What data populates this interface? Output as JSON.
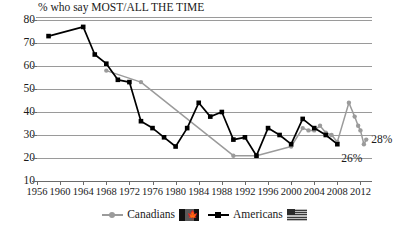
{
  "chart_data": {
    "type": "line",
    "title": "% who say MOST/ALL THE TIME",
    "xlabel": "",
    "ylabel": "",
    "ylim": [
      10,
      80
    ],
    "xlim": [
      1956,
      2014
    ],
    "yticks": [
      80,
      70,
      60,
      50,
      40,
      30,
      20,
      10
    ],
    "xticks": [
      1956,
      1960,
      1964,
      1968,
      1972,
      1976,
      1980,
      1984,
      1988,
      1992,
      1996,
      2000,
      2004,
      2008,
      2012
    ],
    "grid": true,
    "legend_position": "bottom",
    "series": [
      {
        "name": "Canadians",
        "color": "#9b9b9b",
        "marker": "circle",
        "points": [
          {
            "x": 1968,
            "y": 58
          },
          {
            "x": 1974,
            "y": 53
          },
          {
            "x": 1990,
            "y": 21
          },
          {
            "x": 1994,
            "y": 21
          },
          {
            "x": 2000,
            "y": 25
          },
          {
            "x": 2002,
            "y": 33
          },
          {
            "x": 2003,
            "y": 32
          },
          {
            "x": 2004,
            "y": 32
          },
          {
            "x": 2005,
            "y": 34
          },
          {
            "x": 2006,
            "y": 31
          },
          {
            "x": 2007,
            "y": 30
          },
          {
            "x": 2008,
            "y": 27
          },
          {
            "x": 2010,
            "y": 44
          },
          {
            "x": 2011,
            "y": 38
          },
          {
            "x": 2011.6,
            "y": 34
          },
          {
            "x": 2012,
            "y": 32
          },
          {
            "x": 2012.6,
            "y": 26
          },
          {
            "x": 2013,
            "y": 28
          }
        ]
      },
      {
        "name": "Americans",
        "color": "#000000",
        "marker": "square",
        "points": [
          {
            "x": 1958,
            "y": 73
          },
          {
            "x": 1964,
            "y": 77
          },
          {
            "x": 1966,
            "y": 65
          },
          {
            "x": 1968,
            "y": 61
          },
          {
            "x": 1970,
            "y": 54
          },
          {
            "x": 1972,
            "y": 53
          },
          {
            "x": 1974,
            "y": 36
          },
          {
            "x": 1976,
            "y": 33
          },
          {
            "x": 1978,
            "y": 29
          },
          {
            "x": 1980,
            "y": 25
          },
          {
            "x": 1982,
            "y": 33
          },
          {
            "x": 1984,
            "y": 44
          },
          {
            "x": 1986,
            "y": 38
          },
          {
            "x": 1988,
            "y": 40
          },
          {
            "x": 1990,
            "y": 28
          },
          {
            "x": 1992,
            "y": 29
          },
          {
            "x": 1994,
            "y": 21
          },
          {
            "x": 1996,
            "y": 33
          },
          {
            "x": 1998,
            "y": 30
          },
          {
            "x": 2000,
            "y": 26
          },
          {
            "x": 2002,
            "y": 37
          },
          {
            "x": 2004,
            "y": 33
          },
          {
            "x": 2006,
            "y": 30
          },
          {
            "x": 2008,
            "y": 26
          }
        ]
      }
    ],
    "annotations": [
      {
        "label": "26%",
        "x": 2008,
        "y": 26
      },
      {
        "label": "28%",
        "x": 2013,
        "y": 28
      }
    ]
  },
  "legend": {
    "canadians": "Canadians",
    "americans": "Americans",
    "canada_flag_icon": "canada-flag-icon",
    "usa_flag_icon": "usa-flag-icon"
  }
}
